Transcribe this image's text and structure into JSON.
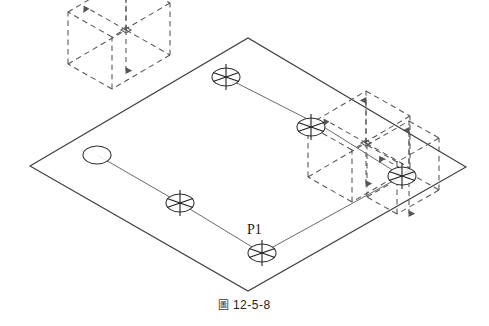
{
  "figure": {
    "caption_mark": "圖",
    "caption_text": "12-5-8",
    "caption_full": "圖 12-5-8",
    "background_color": "#ffffff",
    "line_color": "#3c3c3c",
    "polyline_color": "#6b6b6b",
    "dashed_color": "#555555",
    "text_color": "#1a1a1a"
  },
  "drawing": {
    "type": "isometric-cad-view",
    "ground_plane": {
      "name": "ground-plane-parallelogram",
      "points": [
        [
          30,
          166
        ],
        [
          248,
          38
        ],
        [
          466,
          167
        ],
        [
          248,
          291
        ]
      ]
    },
    "polyline": {
      "name": "3d-polyline",
      "points": [
        [
          97,
          155
        ],
        [
          180,
          203
        ],
        [
          262,
          253
        ],
        [
          402,
          176
        ],
        [
          327,
          129
        ],
        [
          225,
          77
        ]
      ]
    },
    "vertex_markers": [
      {
        "name": "start-node-open",
        "cx": 97,
        "cy": 155,
        "rx": 14,
        "ry": 9,
        "marked": false,
        "label": ""
      },
      {
        "name": "node-snap-marker",
        "cx": 180,
        "cy": 203,
        "rx": 14,
        "ry": 9,
        "marked": true,
        "label": ""
      },
      {
        "name": "node-snap-marker-p1",
        "cx": 262,
        "cy": 253,
        "rx": 14,
        "ry": 9,
        "marked": true,
        "label": "P1"
      },
      {
        "name": "node-snap-marker",
        "cx": 402,
        "cy": 176,
        "rx": 14,
        "ry": 9,
        "marked": true,
        "label": ""
      },
      {
        "name": "node-snap-marker",
        "cx": 311,
        "cy": 127,
        "rx": 14,
        "ry": 9,
        "marked": true,
        "label": ""
      },
      {
        "name": "node-snap-marker",
        "cx": 226,
        "cy": 77,
        "rx": 14,
        "ry": 9,
        "marked": true,
        "label": ""
      }
    ],
    "vertex_labels": [
      {
        "name": "vertex-label-p1",
        "text": "P1",
        "x": 247,
        "y": 222
      }
    ],
    "dashed_boxes": [
      {
        "name": "dashed-ucs-box-upper-left",
        "origin": [
          112,
          89
        ],
        "dx": [
          -44,
          -25
        ],
        "dy": [
          58,
          -34
        ],
        "dz": [
          0,
          -52
        ]
      },
      {
        "name": "dashed-ucs-box-right",
        "origin": [
          352,
          202
        ],
        "dx": [
          -44,
          -25
        ],
        "dy": [
          58,
          -34
        ],
        "dz": [
          0,
          -52
        ]
      },
      {
        "name": "dashed-ucs-box-lower-right",
        "origin": [
          397,
          214
        ],
        "dx": [
          -30,
          -17
        ],
        "dy": [
          42,
          -24
        ],
        "dz": [
          0,
          -52
        ]
      }
    ]
  }
}
